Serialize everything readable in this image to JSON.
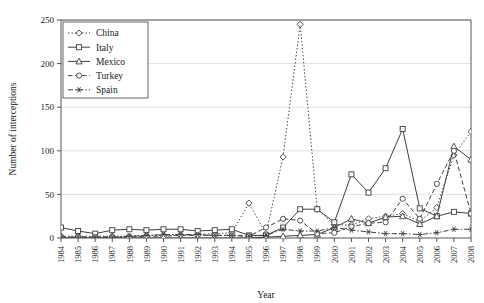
{
  "chart_data": {
    "type": "line",
    "title": "",
    "xlabel": "Year",
    "ylabel": "Number of interceptions",
    "xlim": [
      1984,
      2008
    ],
    "ylim": [
      0,
      250
    ],
    "yticks": [
      0,
      50,
      100,
      150,
      200,
      250
    ],
    "grid": true,
    "legend_position": "top-left",
    "categories": [
      "1984",
      "1985",
      "1986",
      "1987",
      "1988",
      "1989",
      "1990",
      "1991",
      "1992",
      "1993",
      "1994",
      "1995",
      "1996",
      "1997",
      "1998",
      "1999",
      "2000",
      "2001",
      "2002",
      "2003",
      "2004",
      "2005",
      "2006",
      "2007",
      "2008"
    ],
    "series": [
      {
        "name": "China",
        "marker": "diamond",
        "line_style": "dotted",
        "values": [
          2,
          2,
          2,
          2,
          2,
          3,
          3,
          3,
          4,
          5,
          6,
          40,
          5,
          93,
          245,
          33,
          15,
          15,
          22,
          25,
          28,
          19,
          35,
          95,
          122
        ]
      },
      {
        "name": "Italy",
        "marker": "square",
        "line_style": "solid",
        "values": [
          12,
          8,
          5,
          9,
          10,
          9,
          10,
          10,
          8,
          9,
          10,
          3,
          3,
          12,
          33,
          33,
          18,
          73,
          52,
          80,
          125,
          34,
          25,
          30,
          28
        ]
      },
      {
        "name": "Mexico",
        "marker": "triangle",
        "line_style": "solid",
        "values": [
          0,
          0,
          0,
          0,
          0,
          0,
          0,
          0,
          0,
          0,
          0,
          0,
          1,
          2,
          3,
          4,
          12,
          22,
          17,
          24,
          25,
          16,
          25,
          105,
          90
        ]
      },
      {
        "name": "Turkey",
        "marker": "circle",
        "line_style": "dashed",
        "values": [
          1,
          1,
          1,
          1,
          1,
          2,
          2,
          3,
          3,
          3,
          3,
          2,
          12,
          22,
          20,
          5,
          6,
          13,
          17,
          18,
          45,
          22,
          62,
          100,
          28
        ]
      },
      {
        "name": "Spain",
        "marker": "star",
        "line_style": "dashdot",
        "values": [
          1,
          1,
          1,
          1,
          2,
          3,
          4,
          4,
          4,
          3,
          3,
          2,
          3,
          10,
          8,
          8,
          12,
          9,
          7,
          5,
          5,
          4,
          6,
          10,
          10
        ]
      }
    ]
  },
  "legend": {
    "entries": [
      {
        "label": "China"
      },
      {
        "label": "Italy"
      },
      {
        "label": "Mexico"
      },
      {
        "label": "Turkey"
      },
      {
        "label": "Spain"
      }
    ]
  }
}
